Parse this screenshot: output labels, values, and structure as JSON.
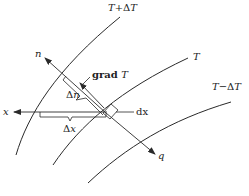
{
  "diagram": {
    "type": "isotherm-gradient",
    "colors": {
      "line": "#2a2a2a",
      "text": "#222222",
      "background": "#ffffff"
    },
    "isotherms": [
      {
        "id": "t_plus",
        "label_main": "T",
        "label_op": "+Δ",
        "label_tail": "T"
      },
      {
        "id": "t",
        "label_main": "T"
      },
      {
        "id": "t_minus",
        "label_main": "T",
        "label_op": "−Δ",
        "label_tail": "T"
      }
    ],
    "labels": {
      "n": "n",
      "grad_word": "grad ",
      "grad_var": "T",
      "delta_n_sym": "Δ",
      "delta_n_var": "n",
      "x": "x",
      "dx": "dx",
      "delta_x_sym": "Δ",
      "delta_x_var": "x",
      "q": "q"
    },
    "caption": ""
  }
}
